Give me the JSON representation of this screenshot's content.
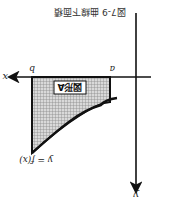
{
  "figure": {
    "caption": "図7-9 曲線下面積",
    "orientation": "rotated 180 degrees",
    "axes": {
      "x_label": "x",
      "y_label": "y"
    },
    "points": {
      "a": "a",
      "b": "b"
    },
    "curve_label": "y = f(x)",
    "region_label": "図形A",
    "colors": {
      "ink": "#111111",
      "shade": "#b8b8b8",
      "background": "#ffffff"
    }
  }
}
